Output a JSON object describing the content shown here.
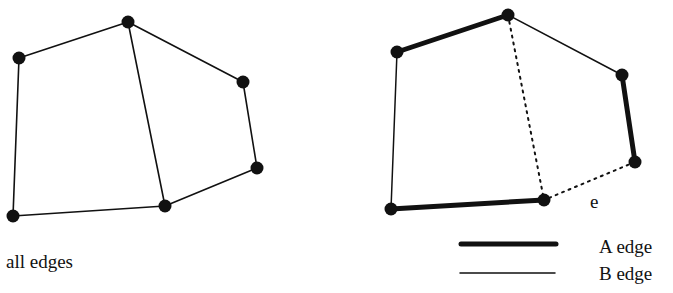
{
  "left_graph": {
    "caption": "all edges",
    "nodes": [
      [
        19,
        58
      ],
      [
        128,
        22
      ],
      [
        243,
        82
      ],
      [
        257,
        168
      ],
      [
        165,
        206
      ],
      [
        13,
        216
      ]
    ],
    "edges": [
      [
        0,
        1
      ],
      [
        1,
        2
      ],
      [
        2,
        3
      ],
      [
        3,
        4
      ],
      [
        4,
        5
      ],
      [
        5,
        0
      ],
      [
        1,
        4
      ]
    ]
  },
  "right_graph": {
    "nodes": [
      [
        397,
        52
      ],
      [
        508,
        15
      ],
      [
        622,
        75
      ],
      [
        635,
        162
      ],
      [
        544,
        200
      ],
      [
        391,
        209
      ]
    ],
    "edges": [
      {
        "from": 0,
        "to": 1,
        "type": "A"
      },
      {
        "from": 1,
        "to": 2,
        "type": "B"
      },
      {
        "from": 2,
        "to": 3,
        "type": "A"
      },
      {
        "from": 3,
        "to": 4,
        "type": "dotted"
      },
      {
        "from": 4,
        "to": 5,
        "type": "A"
      },
      {
        "from": 5,
        "to": 0,
        "type": "B"
      },
      {
        "from": 1,
        "to": 4,
        "type": "dotted"
      }
    ],
    "edge_label": "e"
  },
  "legend": {
    "a_label": "A edge",
    "b_label": "B edge"
  },
  "colors": {
    "ink": "#111111",
    "background": "#ffffff"
  }
}
